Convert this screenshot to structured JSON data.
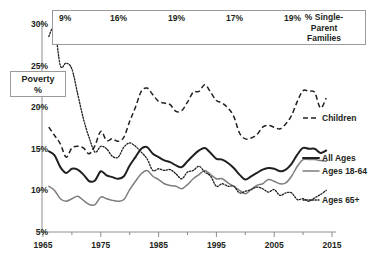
{
  "chart_data": {
    "type": "line",
    "title": "",
    "xlabel": "",
    "ylabel": "Poverty %",
    "xlim": [
      1965,
      2015
    ],
    "ylim": [
      5,
      30
    ],
    "xticks": [
      1965,
      1975,
      1985,
      1995,
      2005,
      2015
    ],
    "xtick_labels": [
      "1965",
      "1975",
      "1985",
      "1995",
      "2005",
      "2015"
    ],
    "yticks": [
      5,
      10,
      15,
      20,
      25,
      30
    ],
    "ytick_labels": [
      "5%",
      "10%",
      "15%",
      "20%",
      "25%",
      "30%"
    ],
    "minor_xticks": [
      1970,
      1980,
      1990,
      2000,
      2010
    ],
    "grid": false,
    "legend_position": "right",
    "series": [
      {
        "name": "Children",
        "style": "dashed",
        "x": [
          1966,
          1967,
          1968,
          1969,
          1970,
          1971,
          1972,
          1973,
          1974,
          1975,
          1976,
          1977,
          1978,
          1979,
          1980,
          1981,
          1982,
          1983,
          1984,
          1985,
          1986,
          1987,
          1988,
          1989,
          1990,
          1991,
          1992,
          1993,
          1994,
          1995,
          1996,
          1997,
          1998,
          1999,
          2000,
          2001,
          2002,
          2003,
          2004,
          2005,
          2006,
          2007,
          2008,
          2009,
          2010,
          2011,
          2012,
          2013,
          2014
        ],
        "values": [
          17.6,
          16.6,
          15.6,
          14.0,
          15.1,
          15.3,
          15.1,
          14.4,
          15.4,
          17.1,
          16.0,
          16.2,
          15.9,
          16.4,
          18.3,
          20.0,
          21.9,
          22.3,
          21.5,
          20.7,
          20.5,
          20.3,
          19.5,
          19.6,
          20.6,
          21.8,
          21.9,
          22.7,
          21.8,
          20.8,
          20.5,
          19.9,
          18.9,
          16.9,
          16.2,
          16.3,
          16.7,
          17.6,
          17.8,
          17.6,
          17.4,
          18.0,
          19.0,
          20.7,
          22.0,
          21.9,
          21.8,
          19.9,
          21.1
        ]
      },
      {
        "name": "All Ages",
        "style": "solid-thick",
        "x": [
          1966,
          1967,
          1968,
          1969,
          1970,
          1971,
          1972,
          1973,
          1974,
          1975,
          1976,
          1977,
          1978,
          1979,
          1980,
          1981,
          1982,
          1983,
          1984,
          1985,
          1986,
          1987,
          1988,
          1989,
          1990,
          1991,
          1992,
          1993,
          1994,
          1995,
          1996,
          1997,
          1998,
          1999,
          2000,
          2001,
          2002,
          2003,
          2004,
          2005,
          2006,
          2007,
          2008,
          2009,
          2010,
          2011,
          2012,
          2013,
          2014
        ],
        "values": [
          14.7,
          14.2,
          12.8,
          12.1,
          12.6,
          12.5,
          11.9,
          11.1,
          11.2,
          12.3,
          11.8,
          11.6,
          11.4,
          11.7,
          13.0,
          14.0,
          15.0,
          15.2,
          14.4,
          14.0,
          13.6,
          13.4,
          13.0,
          12.8,
          13.5,
          14.2,
          14.8,
          15.1,
          14.5,
          13.8,
          13.7,
          13.3,
          12.7,
          11.9,
          11.3,
          11.7,
          12.1,
          12.5,
          12.7,
          12.6,
          12.3,
          12.5,
          13.2,
          14.3,
          15.1,
          15.0,
          15.0,
          14.5,
          14.8
        ]
      },
      {
        "name": "Ages 18-64",
        "style": "solid-gray",
        "x": [
          1966,
          1967,
          1968,
          1969,
          1970,
          1971,
          1972,
          1973,
          1974,
          1975,
          1976,
          1977,
          1978,
          1979,
          1980,
          1981,
          1982,
          1983,
          1984,
          1985,
          1986,
          1987,
          1988,
          1989,
          1990,
          1991,
          1992,
          1993,
          1994,
          1995,
          1996,
          1997,
          1998,
          1999,
          2000,
          2001,
          2002,
          2003,
          2004,
          2005,
          2006,
          2007,
          2008,
          2009,
          2010,
          2011,
          2012,
          2013,
          2014
        ],
        "values": [
          10.5,
          10.0,
          9.0,
          8.7,
          9.0,
          9.3,
          8.8,
          8.3,
          8.3,
          9.2,
          9.0,
          8.8,
          8.7,
          8.9,
          10.1,
          11.1,
          12.0,
          12.4,
          11.7,
          11.3,
          10.8,
          10.6,
          10.5,
          10.2,
          10.7,
          11.4,
          11.9,
          12.4,
          11.9,
          11.4,
          11.4,
          10.9,
          10.5,
          10.0,
          9.6,
          10.1,
          10.6,
          10.8,
          11.3,
          11.1,
          10.8,
          10.9,
          11.7,
          12.9,
          13.7,
          13.7,
          13.7,
          13.6,
          13.5
        ]
      },
      {
        "name": "Ages 65+",
        "style": "dotted",
        "x": [
          1966,
          1967,
          1968,
          1969,
          1970,
          1971,
          1972,
          1973,
          1974,
          1975,
          1976,
          1977,
          1978,
          1979,
          1980,
          1981,
          1982,
          1983,
          1984,
          1985,
          1986,
          1987,
          1988,
          1989,
          1990,
          1991,
          1992,
          1993,
          1994,
          1995,
          1996,
          1997,
          1998,
          1999,
          2000,
          2001,
          2002,
          2003,
          2004,
          2005,
          2006,
          2007,
          2008,
          2009,
          2010,
          2011,
          2012,
          2013,
          2014
        ],
        "values": [
          28.5,
          29.5,
          25.0,
          25.3,
          24.6,
          21.6,
          18.6,
          16.3,
          14.6,
          15.3,
          15.0,
          14.1,
          14.0,
          15.2,
          15.7,
          15.3,
          14.6,
          13.8,
          12.4,
          12.6,
          12.4,
          12.5,
          12.0,
          11.4,
          12.2,
          12.4,
          12.9,
          12.2,
          11.7,
          10.5,
          10.8,
          10.5,
          10.5,
          9.7,
          9.9,
          10.1,
          10.4,
          10.2,
          9.8,
          10.1,
          9.4,
          9.7,
          9.7,
          8.9,
          9.0,
          8.7,
          9.1,
          9.5,
          10.0
        ]
      }
    ],
    "annotation_table": {
      "header": "% Single-Parent Families",
      "cells": [
        {
          "label": "9%",
          "x": 1967
        },
        {
          "label": "16%",
          "x": 1977
        },
        {
          "label": "19%",
          "x": 1987
        },
        {
          "label": "17%",
          "x": 1997
        },
        {
          "label": "19%",
          "x": 2007
        }
      ]
    }
  },
  "annotation_box": {
    "header_line1": "% Single-",
    "header_line2": "Parent",
    "header_line3": "Families",
    "cell_0": "9%",
    "cell_1": "16%",
    "cell_2": "19%",
    "cell_3": "17%",
    "cell_4": "19%"
  },
  "axis": {
    "y_title_line1": "Poverty",
    "y_title_line2": "%",
    "y_labels": [
      "30%",
      "25%",
      "20%",
      "15%",
      "10%",
      "5%"
    ],
    "x_labels": [
      "1965",
      "1975",
      "1985",
      "1995",
      "2005",
      "2015"
    ]
  },
  "legend": {
    "children": "Children",
    "all_ages": "All Ages",
    "ages_18_64": "Ages 18-64",
    "ages_65": "Ages 65+"
  },
  "colors": {
    "ink": "#231f20",
    "gray_line": "#7d7d7d",
    "axis": "#8d8d8d",
    "box_border": "#9a9a9a"
  }
}
